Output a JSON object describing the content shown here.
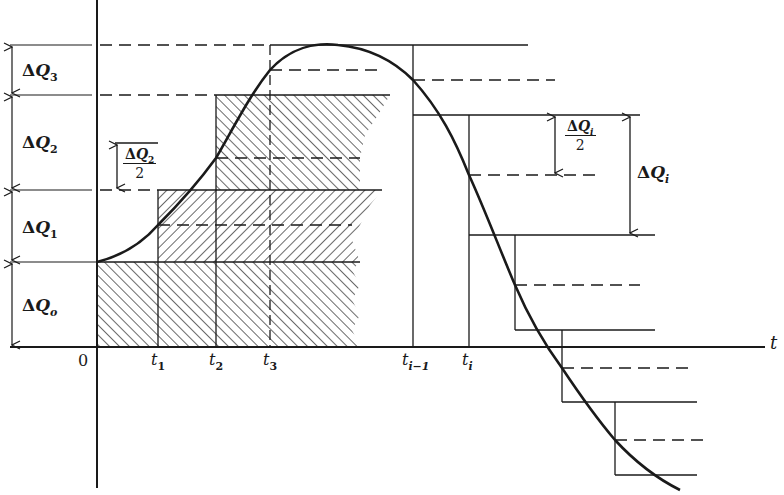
{
  "diagram": {
    "type": "stepwise-approximation",
    "axes": {
      "x_label": "t",
      "origin_label": "0"
    },
    "time_ticks": [
      {
        "id": "t1",
        "base": "t",
        "sub": "1"
      },
      {
        "id": "t2",
        "base": "t",
        "sub": "2"
      },
      {
        "id": "t3",
        "base": "t",
        "sub": "3"
      },
      {
        "id": "ti_minus_1",
        "base": "t",
        "sub": "i−1"
      },
      {
        "id": "ti",
        "base": "t",
        "sub": "i"
      }
    ],
    "left_increments": [
      {
        "id": "dQ3",
        "delta": "Δ",
        "base": "Q",
        "sub": "3"
      },
      {
        "id": "dQ2",
        "delta": "Δ",
        "base": "Q",
        "sub": "2"
      },
      {
        "id": "dQ1",
        "delta": "Δ",
        "base": "Q",
        "sub": "1"
      },
      {
        "id": "dQo",
        "delta": "Δ",
        "base": "Q",
        "sub": "o"
      }
    ],
    "half_increment_left": {
      "delta": "Δ",
      "base": "Q",
      "sub": "2",
      "denominator": "2"
    },
    "half_increment_right": {
      "delta": "Δ",
      "base": "Q",
      "sub": "i",
      "denominator": "2"
    },
    "full_increment_right": {
      "delta": "Δ",
      "base": "Q",
      "sub": "i"
    },
    "colors": {
      "ink": "#1a1a1a",
      "background": "#ffffff"
    }
  }
}
